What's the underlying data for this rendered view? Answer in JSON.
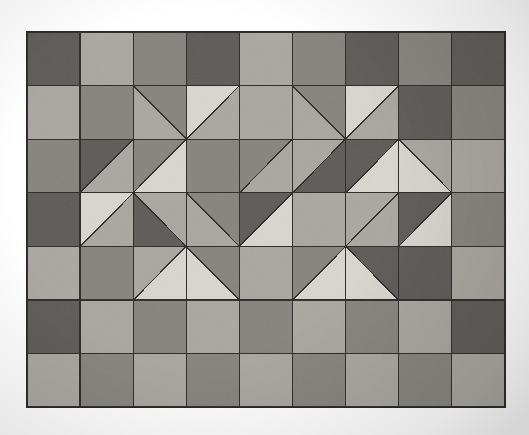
{
  "image": {
    "kind": "photograph-of-quilt-pattern",
    "background_color": "#ffffff",
    "canvas_width": 529,
    "canvas_height": 435
  },
  "palette": {
    "light": "#d8d6cf",
    "medium_light": "#a9a7a0",
    "medium": "#86847e",
    "dark": "#5d5b57",
    "line": "#2b2a28",
    "background": "#ffffff"
  },
  "grid": {
    "origin_x": 27,
    "origin_y": 32,
    "cell_width": 53.1,
    "cell_height": 53.6,
    "columns": 9,
    "rows": 7,
    "line_width": 1.3,
    "line_color": "#2b2a28"
  },
  "legend": {
    "tones": [
      {
        "name": "light",
        "hex": "#d8d6cf"
      },
      {
        "name": "medium-light",
        "hex": "#a9a7a0"
      },
      {
        "name": "medium",
        "hex": "#86847e"
      },
      {
        "name": "dark",
        "hex": "#5d5b57"
      }
    ]
  },
  "chart_data": {
    "type": "heatmap",
    "title": "",
    "xlabel": "",
    "ylabel": "",
    "columns": 9,
    "rows": 7,
    "tone_codes": {
      "L": "light",
      "M": "medium-light",
      "D": "medium",
      "K": "dark"
    },
    "cells": [
      [
        {
          "fill": "K"
        },
        {
          "fill": "M"
        },
        {
          "fill": "D"
        },
        {
          "fill": "K"
        },
        {
          "fill": "M"
        },
        {
          "fill": "D"
        },
        {
          "fill": "K"
        },
        {
          "fill": "D"
        },
        {
          "fill": "K"
        }
      ],
      [
        {
          "fill": "M"
        },
        {
          "fill": "D"
        },
        {
          "split": "tr",
          "a": "D",
          "b": "M"
        },
        {
          "split": "tl",
          "a": "L",
          "b": "M"
        },
        {
          "fill": "M"
        },
        {
          "split": "tr",
          "a": "D",
          "b": "M"
        },
        {
          "split": "tl",
          "a": "L",
          "b": "M"
        },
        {
          "fill": "K"
        },
        {
          "fill": "D"
        }
      ],
      [
        {
          "fill": "D"
        },
        {
          "split": "tl",
          "a": "K",
          "b": "M"
        },
        {
          "split": "br",
          "a": "L",
          "b": "D"
        },
        {
          "fill": "D"
        },
        {
          "split": "br",
          "a": "M",
          "b": "D"
        },
        {
          "split": "tl",
          "a": "M",
          "b": "K"
        },
        {
          "split": "br",
          "a": "L",
          "b": "K"
        },
        {
          "split": "tr",
          "a": "M",
          "b": "L"
        },
        {
          "fill": "M"
        }
      ],
      [
        {
          "fill": "K"
        },
        {
          "split": "br",
          "a": "M",
          "b": "L"
        },
        {
          "split": "tr",
          "a": "M",
          "b": "K"
        },
        {
          "split": "bl",
          "a": "M",
          "b": "D"
        },
        {
          "split": "br",
          "a": "L",
          "b": "K"
        },
        {
          "fill": "M"
        },
        {
          "split": "br",
          "a": "M",
          "b": "M"
        },
        {
          "split": "br",
          "a": "L",
          "b": "K"
        },
        {
          "fill": "D"
        }
      ],
      [
        {
          "fill": "M"
        },
        {
          "fill": "D"
        },
        {
          "split": "br",
          "a": "L",
          "b": "M"
        },
        {
          "split": "bl",
          "a": "L",
          "b": "D"
        },
        {
          "fill": "M"
        },
        {
          "split": "br",
          "a": "L",
          "b": "D"
        },
        {
          "split": "bl",
          "a": "L",
          "b": "K"
        },
        {
          "fill": "K"
        },
        {
          "fill": "M"
        }
      ],
      [
        {
          "fill": "K"
        },
        {
          "fill": "M"
        },
        {
          "fill": "D"
        },
        {
          "fill": "M"
        },
        {
          "fill": "D"
        },
        {
          "fill": "M"
        },
        {
          "fill": "D"
        },
        {
          "fill": "M"
        },
        {
          "fill": "K"
        }
      ],
      [
        {
          "fill": "M"
        },
        {
          "fill": "D"
        },
        {
          "fill": "M"
        },
        {
          "fill": "D"
        },
        {
          "fill": "M"
        },
        {
          "fill": "D"
        },
        {
          "fill": "M"
        },
        {
          "fill": "D"
        },
        {
          "fill": "M"
        }
      ]
    ],
    "motifs": [
      {
        "name": "left-diamond",
        "center_cell": [
          3,
          2
        ],
        "description": "large diamond formed of light and medium triangles surrounding a dark square core"
      },
      {
        "name": "right-diamond",
        "center_cell": [
          6,
          2
        ],
        "description": "large diamond formed of light and medium triangles surrounding a dark square core"
      }
    ]
  }
}
